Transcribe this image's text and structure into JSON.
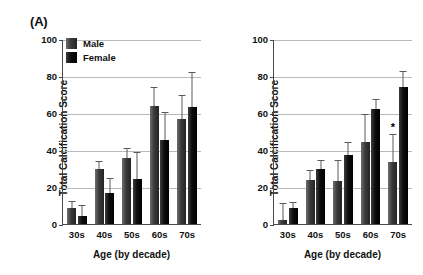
{
  "figure": {
    "panels": [
      {
        "panel_label": "(A)",
        "legend": [
          {
            "label": "Male",
            "shade": "gray"
          },
          {
            "label": "Female",
            "shade": "black"
          }
        ],
        "chart_data": {
          "type": "bar",
          "title": "(A)",
          "xlabel": "Age (by decade)",
          "ylabel": "Total Calcification Score",
          "ylim": [
            0,
            100
          ],
          "yticks": [
            0,
            20,
            40,
            60,
            80,
            100
          ],
          "grid": true,
          "legend_position": "top-left",
          "categories": [
            "30s",
            "40s",
            "50s",
            "60s",
            "70s"
          ],
          "series": [
            {
              "name": "Male",
              "values": [
                8.5,
                30.0,
                35.5,
                64.0,
                57.0
              ],
              "errors": [
                3.5,
                3.5,
                5.0,
                9.5,
                12.0
              ]
            },
            {
              "name": "Female",
              "values": [
                4.5,
                16.5,
                24.5,
                45.5,
                63.0
              ],
              "errors": [
                5.0,
                8.0,
                14.0,
                14.5,
                18.5
              ]
            }
          ],
          "annotations": []
        }
      },
      {
        "panel_label": "(B)",
        "legend": [
          {
            "label": "Black",
            "shade": "gray"
          },
          {
            "label": "White",
            "shade": "black"
          }
        ],
        "chart_data": {
          "type": "bar",
          "title": "(B)",
          "xlabel": "Age (by decade)",
          "ylabel": "Total Calcification Score",
          "ylim": [
            0,
            100
          ],
          "yticks": [
            0,
            20,
            40,
            60,
            80,
            100
          ],
          "grid": true,
          "legend_position": "top-left",
          "categories": [
            "30s",
            "40s",
            "50s",
            "60s",
            "70s"
          ],
          "series": [
            {
              "name": "Black",
              "values": [
                2.0,
                24.0,
                23.0,
                44.5,
                33.5
              ],
              "errors": [
                9.0,
                4.5,
                11.0,
                14.5,
                14.5
              ]
            },
            {
              "name": "White",
              "values": [
                8.5,
                29.5,
                37.5,
                62.0,
                74.0
              ],
              "errors": [
                3.0,
                4.5,
                6.5,
                5.0,
                8.0
              ]
            }
          ],
          "annotations": [
            {
              "text": "*",
              "category": "70s",
              "series": "Black"
            }
          ]
        }
      }
    ]
  }
}
